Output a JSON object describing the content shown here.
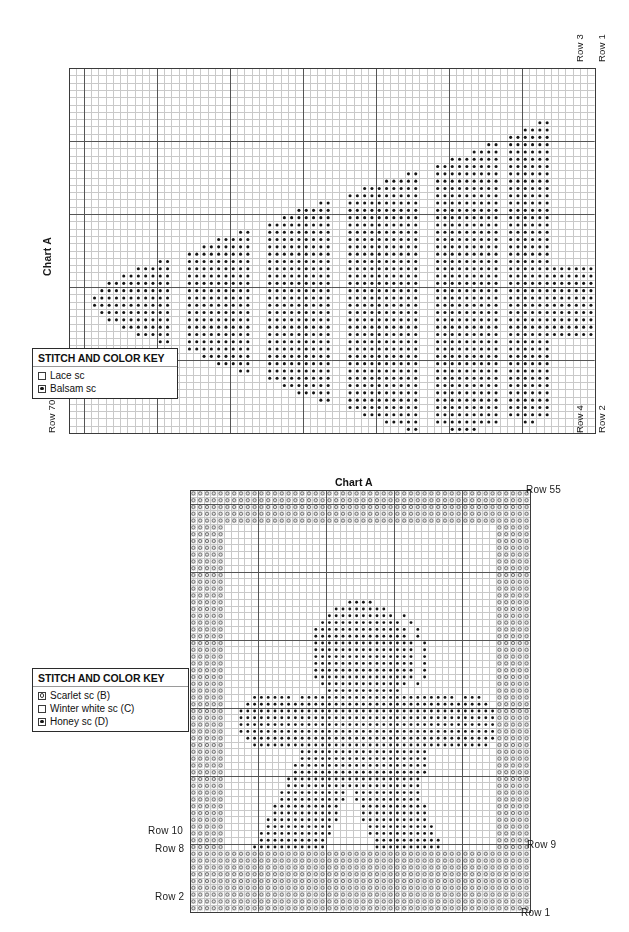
{
  "page": {
    "width": 629,
    "height": 932,
    "background": "#ffffff"
  },
  "chart_data": {
    "type": "table",
    "charts": [
      {
        "id": "chart-1",
        "name": "Chart A",
        "title": "Chart A",
        "cols": 72,
        "rows": 50,
        "cell_px": 7.3,
        "origin": {
          "x": 69,
          "y": 68
        },
        "heavy_every": 10,
        "symbols": {
          "empty": "Lace sc",
          "dot": "Balsam sc"
        },
        "labels": {
          "top_right": [
            "Row 3",
            "Row 1"
          ],
          "bottom_right": [
            "Row 4",
            "Row 2"
          ],
          "bottom_left": [
            "Row 70"
          ],
          "left_side": "Chart A"
        },
        "key": {
          "title": "STITCH AND COLOR KEY",
          "entries": [
            {
              "symbol": "empty",
              "label": "Lace sc"
            },
            {
              "symbol": "dot",
              "label": "Balsam sc"
            }
          ]
        }
      },
      {
        "id": "chart-2",
        "name": "Chart A",
        "title": "Chart A",
        "cols": 50,
        "rows": 62,
        "cell_px": 6.8,
        "origin": {
          "x": 190,
          "y": 490
        },
        "heavy_every": 10,
        "symbols": {
          "circle": "Scarlet sc (B)",
          "empty": "Winter white sc (C)",
          "dot": "Honey sc (D)"
        },
        "labels": {
          "top_right": [
            "Row 55"
          ],
          "right_side": [
            "Row 9",
            "Row 1"
          ],
          "left_side": [
            "Row 10",
            "Row 8",
            "Row 2"
          ]
        },
        "key": {
          "title": "STITCH AND COLOR KEY",
          "entries": [
            {
              "symbol": "circle",
              "label": "Scarlet sc (B)"
            },
            {
              "symbol": "empty",
              "label": "Winter white sc (C)"
            },
            {
              "symbol": "dot",
              "label": "Honey sc (D)"
            }
          ]
        }
      }
    ]
  },
  "chart1": {
    "title": "Chart A",
    "side_label": "Chart A",
    "row_top_3": "Row 3",
    "row_top_1": "Row 1",
    "row_bottom_4": "Row 4",
    "row_bottom_2": "Row 2",
    "row_bottom_70": "Row 70",
    "key": {
      "title": "STITCH AND COLOR KEY",
      "item1": "Lace sc",
      "item2": "Balsam sc"
    }
  },
  "chart2": {
    "title": "Chart A",
    "row_55": "Row 55",
    "row_10": "Row 10",
    "row_8": "Row 8",
    "row_9": "Row 9",
    "row_2": "Row 2",
    "row_1": "Row 1",
    "key": {
      "title": "STITCH AND COLOR KEY",
      "item1": "Scarlet sc (B)",
      "item2": "Winter white sc (C)",
      "item3": "Honey sc (D)"
    }
  },
  "colors": {
    "grid_light": "#c9c9c9",
    "grid_heavy": "#555555",
    "dot": "#141414",
    "circle_outline": "#6a6a6a",
    "cell_tint": "#e3e3e3",
    "text": "#141414"
  }
}
